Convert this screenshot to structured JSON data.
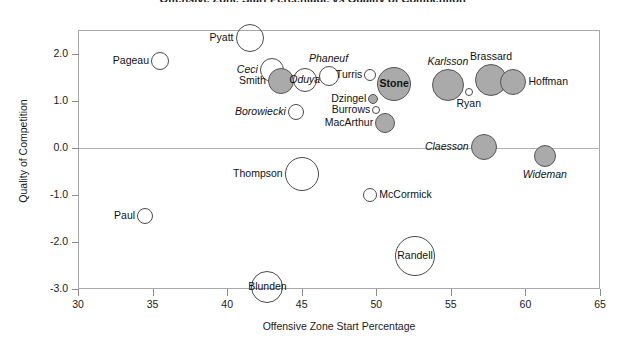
{
  "chart": {
    "title": "Offensive Zone Start Percentage vs Quality of Competition",
    "xlabel": "Offensive Zone Start Percentage",
    "ylabel": "Quality of Competition",
    "xticks": [
      "30",
      "35",
      "40",
      "45",
      "50",
      "55",
      "60",
      "65"
    ],
    "yticks": [
      "2.0",
      "1.0",
      "0.0",
      "-1.0",
      "-2.0",
      "-3.0"
    ]
  },
  "chart_data": {
    "type": "scatter",
    "title": "Offensive Zone Start Percentage vs Quality of Competition",
    "xlabel": "Offensive Zone Start Percentage",
    "ylabel": "Quality of Competition",
    "xlim": [
      30,
      65
    ],
    "ylim": [
      -3.0,
      2.5
    ],
    "xticks": [
      30,
      35,
      40,
      45,
      50,
      55,
      60,
      65
    ],
    "yticks": [
      2.0,
      1.0,
      0.0,
      -1.0,
      -2.0,
      -3.0
    ],
    "grid": false,
    "legend": "none",
    "zero_reference_line_y": 0.0,
    "bubble_size_encodes": "time on ice",
    "fill_encodes": "defencemen shown italic / shaded",
    "points": [
      {
        "label": "Pageau",
        "x": 35.5,
        "y": 1.84,
        "r": 9,
        "fill": "open",
        "style": "normal",
        "label_pos": "left"
      },
      {
        "label": "Pyatt",
        "x": 41.5,
        "y": 2.34,
        "r": 14,
        "fill": "open",
        "style": "normal",
        "label_pos": "left"
      },
      {
        "label": "Ceci",
        "x": 43.0,
        "y": 1.66,
        "r": 12,
        "fill": "open",
        "style": "italic",
        "label_pos": "left"
      },
      {
        "label": "Smith",
        "x": 43.6,
        "y": 1.42,
        "r": 13,
        "fill": "filled",
        "style": "normal",
        "label_pos": "left"
      },
      {
        "label": "Oduya",
        "x": 45.2,
        "y": 1.44,
        "r": 12,
        "fill": "open",
        "style": "italic",
        "label_pos": "over"
      },
      {
        "label": "Phaneuf",
        "x": 46.8,
        "y": 1.52,
        "r": 10,
        "fill": "open",
        "style": "italic",
        "label_pos": "above"
      },
      {
        "label": "Borowiecki",
        "x": 44.6,
        "y": 0.76,
        "r": 8,
        "fill": "open",
        "style": "italic",
        "label_pos": "left"
      },
      {
        "label": "Turris",
        "x": 49.6,
        "y": 1.54,
        "r": 6,
        "fill": "open",
        "style": "normal",
        "label_pos": "left"
      },
      {
        "label": "Dzingel",
        "x": 49.8,
        "y": 1.04,
        "r": 5,
        "fill": "filled",
        "style": "normal",
        "label_pos": "left"
      },
      {
        "label": "Burrows",
        "x": 50.0,
        "y": 0.8,
        "r": 4,
        "fill": "open",
        "style": "normal",
        "label_pos": "left"
      },
      {
        "label": "MacArthur",
        "x": 50.6,
        "y": 0.52,
        "r": 10,
        "fill": "filled",
        "style": "normal",
        "label_pos": "left"
      },
      {
        "label": "Stone",
        "x": 51.2,
        "y": 1.36,
        "r": 17,
        "fill": "filled",
        "style": "normal",
        "label_pos": "over-bold"
      },
      {
        "label": "Karlsson",
        "x": 54.8,
        "y": 1.34,
        "r": 16,
        "fill": "filled",
        "style": "italic",
        "label_pos": "above"
      },
      {
        "label": "Ryan",
        "x": 56.2,
        "y": 1.18,
        "r": 4,
        "fill": "open",
        "style": "normal",
        "label_pos": "below"
      },
      {
        "label": "Brassard",
        "x": 57.7,
        "y": 1.44,
        "r": 16,
        "fill": "filled",
        "style": "normal",
        "label_pos": "above"
      },
      {
        "label": "Hoffman",
        "x": 59.2,
        "y": 1.4,
        "r": 13,
        "fill": "filled",
        "style": "normal",
        "label_pos": "right"
      },
      {
        "label": "Claesson",
        "x": 57.2,
        "y": 0.02,
        "r": 13,
        "fill": "filled",
        "style": "italic",
        "label_pos": "left"
      },
      {
        "label": "Wideman",
        "x": 61.3,
        "y": -0.18,
        "r": 11,
        "fill": "filled",
        "style": "italic",
        "label_pos": "below"
      },
      {
        "label": "Thompson",
        "x": 45.0,
        "y": -0.55,
        "r": 17,
        "fill": "open",
        "style": "normal",
        "label_pos": "left"
      },
      {
        "label": "McCormick",
        "x": 49.6,
        "y": -1.0,
        "r": 7,
        "fill": "open",
        "style": "normal",
        "label_pos": "right"
      },
      {
        "label": "Paul",
        "x": 34.5,
        "y": -1.44,
        "r": 8,
        "fill": "open",
        "style": "normal",
        "label_pos": "left"
      },
      {
        "label": "Randell",
        "x": 52.6,
        "y": -2.3,
        "r": 20,
        "fill": "open",
        "style": "normal",
        "label_pos": "over"
      },
      {
        "label": "Blunden",
        "x": 42.7,
        "y": -2.96,
        "r": 16,
        "fill": "open",
        "style": "normal",
        "label_pos": "over"
      }
    ]
  }
}
